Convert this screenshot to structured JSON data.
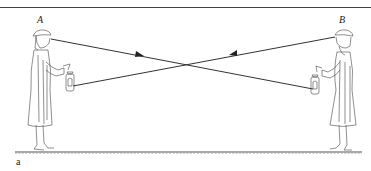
{
  "figure": {
    "panel_label": "a",
    "observers": [
      {
        "id": "A",
        "label": "A",
        "side": "left",
        "holds": "lantern"
      },
      {
        "id": "B",
        "label": "B",
        "side": "right",
        "holds": "lantern"
      }
    ],
    "rays": [
      {
        "from": "A eye",
        "to": "B lantern",
        "direction": "A to B"
      },
      {
        "from": "B eye",
        "to": "A lantern",
        "direction": "B to A"
      }
    ],
    "colors": {
      "line": "#333333",
      "background": "#ffffff"
    }
  }
}
